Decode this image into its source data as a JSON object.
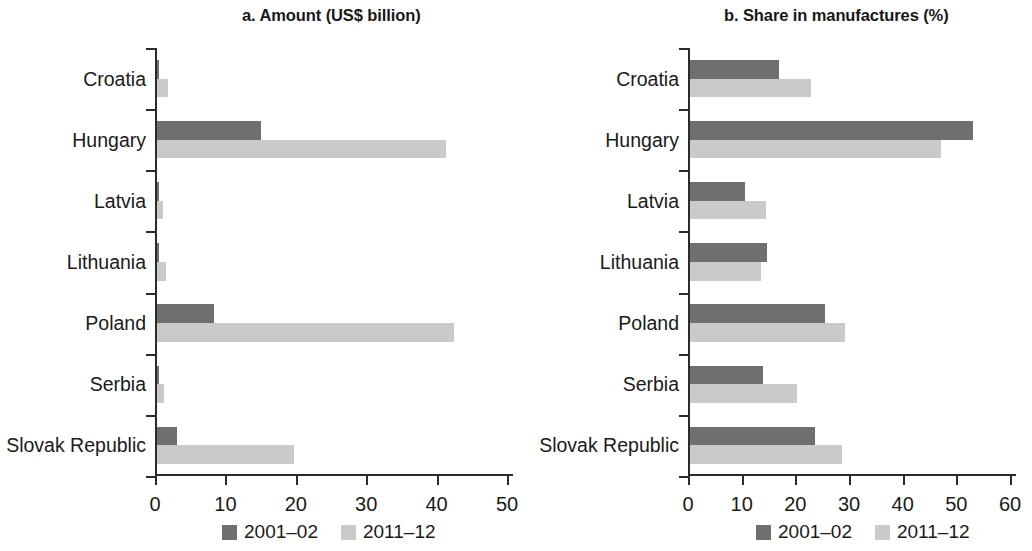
{
  "chart_data": [
    {
      "type": "bar",
      "id": "panel-a",
      "title": "a. Amount (US$ billion)",
      "orientation": "horizontal",
      "xlabel": "",
      "ylabel": "",
      "xlim": [
        0,
        50
      ],
      "xticks": [
        0,
        10,
        20,
        30,
        40,
        50
      ],
      "xtick_labels": [
        "0",
        "10",
        "20",
        "30",
        "40",
        "50"
      ],
      "categories": [
        "Croatia",
        "Hungary",
        "Latvia",
        "Lithuania",
        "Poland",
        "Serbia",
        "Slovak Republic"
      ],
      "grid": false,
      "legend_position": "bottom",
      "series": [
        {
          "name": "2001–02",
          "color": "#6f6f6f",
          "values": [
            0.3,
            14.8,
            0.1,
            0.3,
            8.1,
            0.1,
            2.9
          ]
        },
        {
          "name": "2011–12",
          "color": "#cacaca",
          "values": [
            1.5,
            41.0,
            0.8,
            1.3,
            42.2,
            1.0,
            19.5
          ]
        }
      ]
    },
    {
      "type": "bar",
      "id": "panel-b",
      "title": "b. Share in manufactures (%)",
      "orientation": "horizontal",
      "xlabel": "",
      "ylabel": "",
      "xlim": [
        0,
        60
      ],
      "xticks": [
        0,
        10,
        20,
        30,
        40,
        50,
        60
      ],
      "xtick_labels": [
        "0",
        "10",
        "20",
        "30",
        "40",
        "50",
        "60"
      ],
      "categories": [
        "Croatia",
        "Hungary",
        "Latvia",
        "Lithuania",
        "Poland",
        "Serbia",
        "Slovak Republic"
      ],
      "grid": false,
      "legend_position": "bottom",
      "series": [
        {
          "name": "2001–02",
          "color": "#6f6f6f",
          "values": [
            16.5,
            52.8,
            10.2,
            14.3,
            25.2,
            13.6,
            23.2
          ]
        },
        {
          "name": "2011–12",
          "color": "#cacaca",
          "values": [
            22.5,
            46.7,
            14.2,
            13.2,
            28.9,
            20.0,
            28.4
          ]
        }
      ]
    }
  ],
  "panel_a": {
    "title": "a. Amount (US$ billion)",
    "categories": [
      "Croatia",
      "Hungary",
      "Latvia",
      "Lithuania",
      "Poland",
      "Serbia",
      "Slovak Republic"
    ],
    "xtick_labels": [
      "0",
      "10",
      "20",
      "30",
      "40",
      "50"
    ],
    "legend": [
      "2001–02",
      "2011–12"
    ]
  },
  "panel_b": {
    "title": "b. Share in manufactures (%)",
    "categories": [
      "Croatia",
      "Hungary",
      "Latvia",
      "Lithuania",
      "Poland",
      "Serbia",
      "Slovak Republic"
    ],
    "xtick_labels": [
      "0",
      "10",
      "20",
      "30",
      "40",
      "50",
      "60"
    ],
    "legend": [
      "2001–02",
      "2011–12"
    ]
  },
  "colors": {
    "series_2001_02": "#6f6f6f",
    "series_2011_12": "#cacaca",
    "axis": "#2b2b2b",
    "text": "#1a1a1a",
    "background": "#ffffff"
  }
}
